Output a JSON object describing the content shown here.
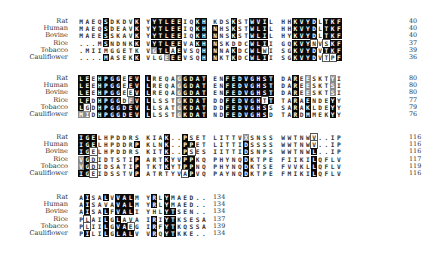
{
  "figure": {
    "type": "multiple_sequence_alignment",
    "species": [
      "Rat",
      "Human",
      "Bovine",
      "Rice",
      "Tobacco",
      "Cauliflower"
    ],
    "shading_legend": {
      "b": "identical/conserved (black)",
      "g": "similar (gray)",
      "w": "boxed (white)"
    },
    "blocks": [
      {
        "top": 18,
        "rows": [
          {
            "label": "Rat",
            "segments": [
              "MAEQSDKDVK",
              "YYTLEEIQKH",
              "KDSKSTWVIL",
              "HHKVYDLTKF"
            ],
            "end": "40",
            "shade": [
              "....b....b",
              ".bbbbb..bb",
              "...b..bbb.",
              "..bbbb.bbb"
            ]
          },
          {
            "label": "Human",
            "segments": [
              "MAEQSDEAVK",
              "YYTLEEIQKH",
              "NHSKSTWLIL",
              "HHKVYDLTKF"
            ],
            "end": "40",
            "shade": [
              "....b....b",
              ".bbbbb..bb",
              "b..b..bbb.",
              "..bbbb.bbb"
            ]
          },
          {
            "label": "Bovine",
            "segments": [
              "MAEESSKAVK",
              "YYTLEEIQKH",
              "NNSKSTWLIL",
              "HYKVYDLTKF"
            ],
            "end": "40",
            "shade": [
              "....b....b",
              ".bbbbb..bb",
              "b..b..bbb.",
              "..bbbb.bbb"
            ]
          },
          {
            "label": "Rice",
            "segments": [
              "...MSNDNKK",
              "VYTLEEVAKH",
              "NSKDDCWLII",
              "GQKVYNVSKF"
            ],
            "end": "37",
            "shade": [
              "....b....b",
              ".bbbbb..bb",
              "b.....bbb.",
              "..bbbw.wbb"
            ]
          },
          {
            "label": "Tobacco",
            "segments": [
              ".MIIMGGETK",
              "VGTLAEVSQH",
              "NNAKDCWLWI",
              "SGKVYDVTKF"
            ],
            "end": "39",
            "shade": [
              "..........b",
              ".gbbwb...b",
              "b..b..bbw.",
              "..bbbb.bbb"
            ]
          },
          {
            "label": "Cauliflower",
            "segments": [
              "....MASEKK",
              "VLGEEEVSQH",
              "NKTKDCWLII",
              "SGKVYDVTPF"
            ],
            "end": "36",
            "shade": [
              "....b....b",
              "...gbb...b",
              "b..b..bbb.",
              "..bbbb.wwb"
            ]
          }
        ]
      },
      {
        "top": 75,
        "rows": [
          {
            "label": "Rat",
            "segments": [
              "LEEHPGGEEV",
              "LREQAGGDAT",
              "ENFEDVGHST",
              "DAREESKTYI"
            ],
            "end": "80",
            "shade": [
              "bb.bbbb.bb",
              "b....gbbbb",
              "..bbbbbbbb",
              "..b.g...g."
            ]
          },
          {
            "label": "Human",
            "segments": [
              "LEEHPGGEEV",
              "LREQAGGDAT",
              "ENFEDVGHST",
              "DAREESKTSI"
            ],
            "end": "80",
            "shade": [
              "bb.bbbb.bb",
              "b....gbbbb",
              "..bbbbbbbb",
              "..b.g...g."
            ]
          },
          {
            "label": "Bovine",
            "segments": [
              "LEEHPGGEEV",
              "LREQAGGDAT",
              "ENFEDVGHST",
              "DAREESKTSI"
            ],
            "end": "80",
            "shade": [
              "bb.bbbb.wb",
              "b....gbbbb",
              "..bbbbbbbb",
              "..b.g...g."
            ]
          },
          {
            "label": "Rice",
            "segments": [
              "LFDHPGGDFV",
              "LLSSTGKDAT",
              "DDFEDVGHTT",
              "TARAENDEYY"
            ],
            "end": "77",
            "shade": [
              "bb.bbbb.gb",
              "b....gbbbb",
              "..bbbbbbwb",
              "..b.b...b."
            ]
          },
          {
            "label": "Tobacco",
            "segments": [
              "LGDHPGGDEV",
              "LLSATGKDAT",
              "DDFEDVGHSS",
              "SARAKLDEYY"
            ],
            "end": "79",
            "shade": [
              "bw.bbbbbbb",
              "b....gbbbb",
              "..bbbbbbb.",
              "..b.b...b."
            ]
          },
          {
            "label": "Cauliflower",
            "segments": [
              "MIDHPGGDEV",
              "LLSSTGKDAT",
              "NDFEDVGHSD",
              "TARDMMEKYY"
            ],
            "end": "76",
            "shade": [
              "gg.bbbbbbb",
              "b....gbbbb",
              "..bbbbbbb.",
              "..b.b...b."
            ]
          }
        ]
      },
      {
        "top": 134,
        "rows": [
          {
            "label": "Rat",
            "segments": [
              "IGELHPDDRS",
              "KIAK..PSET",
              "LITTVXSNSS",
              "WWTNWV..IP"
            ],
            "end": "116",
            "shade": [
              "bbb.......",
              "...b..b...",
              ".....g....",
              ".....w...."
            ]
          },
          {
            "label": "Human",
            "segments": [
              "IGELHPDDRP",
              "KLNK..PPET",
              "LITTIDSSSS",
              "WWTNWV..IP"
            ],
            "end": "116",
            "shade": [
              "bbb......b",
              "...b..bb..",
              ".....b....",
              ".....w...."
            ]
          },
          {
            "label": "Bovine",
            "segments": [
              "IGELHPDDRS",
              "KITK..PSES",
              "IITTIDSNPS",
              "WWTNWL..IP"
            ],
            "end": "116",
            "shade": [
              "bbw.......",
              "...b..bw..",
              ".....b....",
              ".....b...."
            ]
          },
          {
            "label": "Rice",
            "segments": [
              "VGDIDTSTIP",
              "ARTKYVPPKQ",
              "PHYNQDKTPE",
              "FIIKILQFLV"
            ],
            "end": "117",
            "shade": [
              "gbw......b",
              "...b..bb..",
              ".....b....",
              ".....b...."
            ]
          },
          {
            "label": "Tobacco",
            "segments": [
              "VGDIDSATIP",
              "TKTKYTPPNQ",
              "PHYNQDKTSE",
              "FVVKLLQFLV"
            ],
            "end": "119",
            "shade": [
              "gbw......b",
              "...b..bb..",
              ".....b....",
              ".....b...."
            ]
          },
          {
            "label": "Cauliflower",
            "segments": [
              "IGEIDSSTVP",
              "ATRTYVAPVQ",
              "PAYNQDKTPE",
              "FMIKILQFLV"
            ],
            "end": "116",
            "shade": [
              "bbw......b",
              "......wb..",
              ".....b....",
              ".....b...."
            ]
          }
        ]
      },
      {
        "top": 194,
        "rows": [
          {
            "label": "Rat",
            "segments": [
              "AISALVVALM",
              "YRLYMAED.."
            ],
            "end": "134",
            "shade": [
              ".b..b.bbb.",
              ".b.b......"
            ]
          },
          {
            "label": "Human",
            "segments": [
              "AISAVAVALM",
              "YRLYMAED.."
            ],
            "end": "134",
            "shade": [
              ".b....bbb.",
              ".b.b......"
            ]
          },
          {
            "label": "Bovine",
            "segments": [
              "AISALFVALI",
              "YHLYTSEN.."
            ],
            "end": "134",
            "shade": [
              ".b..b.bbb.",
              "...bb....."
            ]
          },
          {
            "label": "Rice",
            "segments": [
              "PLAILGLAVA",
              "IRIYTKSESA"
            ],
            "end": "137",
            "shade": [
              ".w..b.b...",
              ".b.bb....."
            ]
          },
          {
            "label": "Tobacco",
            "segments": [
              "PLIILGVAEG",
              "IRFYTKQSSA"
            ],
            "end": "139",
            "shade": [
              ".w..b.bbw.",
              ".b.bb....."
            ]
          },
          {
            "label": "Cauliflower",
            "segments": [
              "PILILGLALV",
              "VRQYTKKE.."
            ],
            "end": "134",
            "shade": [
              ".b..b.bbb.",
              ".b.bb....."
            ]
          }
        ]
      }
    ]
  }
}
